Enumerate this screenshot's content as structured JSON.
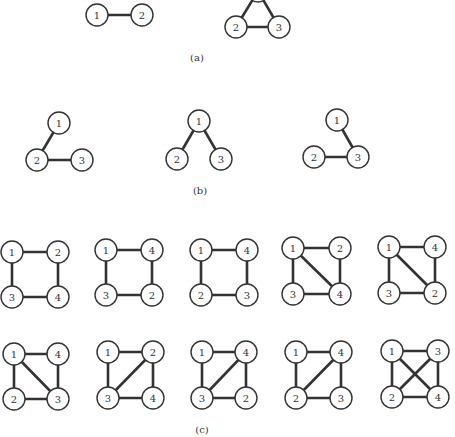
{
  "style": {
    "ink": "#333333",
    "background": "#ffffff",
    "node_radius": 11
  },
  "captions": {
    "a": "(a)",
    "b": "(b)",
    "c": "(c)"
  },
  "caption_positions": {
    "a": [
      197,
      52
    ],
    "b": [
      200,
      185
    ],
    "c": [
      202,
      424
    ]
  },
  "graphs": [
    {
      "part": "a",
      "id": "a1",
      "nodes": [
        {
          "label": "1",
          "x": 97,
          "y": 15
        },
        {
          "label": "2",
          "x": 142,
          "y": 15
        }
      ],
      "edges": [
        [
          "1",
          "2"
        ]
      ]
    },
    {
      "part": "a",
      "id": "a2",
      "nodes": [
        {
          "label": "1",
          "x": 258,
          "y": -9
        },
        {
          "label": "2",
          "x": 236,
          "y": 27
        },
        {
          "label": "3",
          "x": 279,
          "y": 27
        }
      ],
      "edges": [
        [
          "1",
          "2"
        ],
        [
          "1",
          "3"
        ],
        [
          "2",
          "3"
        ]
      ]
    },
    {
      "part": "b",
      "id": "b1",
      "nodes": [
        {
          "label": "1",
          "x": 59,
          "y": 123
        },
        {
          "label": "2",
          "x": 37,
          "y": 160
        },
        {
          "label": "3",
          "x": 82,
          "y": 160
        }
      ],
      "edges": [
        [
          "1",
          "2"
        ],
        [
          "2",
          "3"
        ]
      ]
    },
    {
      "part": "b",
      "id": "b2",
      "nodes": [
        {
          "label": "1",
          "x": 199,
          "y": 121
        },
        {
          "label": "2",
          "x": 177,
          "y": 159
        },
        {
          "label": "3",
          "x": 221,
          "y": 159
        }
      ],
      "edges": [
        [
          "1",
          "2"
        ],
        [
          "1",
          "3"
        ]
      ]
    },
    {
      "part": "b",
      "id": "b3",
      "nodes": [
        {
          "label": "1",
          "x": 337,
          "y": 120
        },
        {
          "label": "2",
          "x": 314,
          "y": 157
        },
        {
          "label": "3",
          "x": 358,
          "y": 157
        }
      ],
      "edges": [
        [
          "1",
          "3"
        ],
        [
          "2",
          "3"
        ]
      ]
    },
    {
      "part": "c",
      "id": "c1",
      "nodes": [
        {
          "label": "1",
          "x": 12,
          "y": 252
        },
        {
          "label": "2",
          "x": 58,
          "y": 252
        },
        {
          "label": "3",
          "x": 12,
          "y": 297
        },
        {
          "label": "4",
          "x": 58,
          "y": 297
        }
      ],
      "edges": [
        [
          "1",
          "2"
        ],
        [
          "2",
          "4"
        ],
        [
          "4",
          "3"
        ],
        [
          "3",
          "1"
        ]
      ]
    },
    {
      "part": "c",
      "id": "c2",
      "nodes": [
        {
          "label": "1",
          "x": 106,
          "y": 250
        },
        {
          "label": "4",
          "x": 152,
          "y": 250
        },
        {
          "label": "3",
          "x": 106,
          "y": 295
        },
        {
          "label": "2",
          "x": 152,
          "y": 295
        }
      ],
      "edges": [
        [
          "1",
          "4"
        ],
        [
          "4",
          "2"
        ],
        [
          "2",
          "3"
        ],
        [
          "3",
          "1"
        ]
      ]
    },
    {
      "part": "c",
      "id": "c3",
      "nodes": [
        {
          "label": "1",
          "x": 201,
          "y": 250
        },
        {
          "label": "4",
          "x": 247,
          "y": 250
        },
        {
          "label": "2",
          "x": 201,
          "y": 295
        },
        {
          "label": "3",
          "x": 247,
          "y": 295
        }
      ],
      "edges": [
        [
          "1",
          "4"
        ],
        [
          "4",
          "3"
        ],
        [
          "3",
          "2"
        ],
        [
          "2",
          "1"
        ]
      ]
    },
    {
      "part": "c",
      "id": "c4",
      "nodes": [
        {
          "label": "1",
          "x": 293,
          "y": 248
        },
        {
          "label": "2",
          "x": 340,
          "y": 248
        },
        {
          "label": "3",
          "x": 293,
          "y": 294
        },
        {
          "label": "4",
          "x": 340,
          "y": 294
        }
      ],
      "edges": [
        [
          "1",
          "2"
        ],
        [
          "2",
          "4"
        ],
        [
          "4",
          "3"
        ],
        [
          "3",
          "1"
        ],
        [
          "1",
          "4"
        ]
      ]
    },
    {
      "part": "c",
      "id": "c5",
      "nodes": [
        {
          "label": "1",
          "x": 389,
          "y": 247
        },
        {
          "label": "4",
          "x": 435,
          "y": 247
        },
        {
          "label": "3",
          "x": 389,
          "y": 293
        },
        {
          "label": "2",
          "x": 435,
          "y": 293
        }
      ],
      "edges": [
        [
          "1",
          "4"
        ],
        [
          "4",
          "2"
        ],
        [
          "2",
          "3"
        ],
        [
          "3",
          "1"
        ],
        [
          "1",
          "2"
        ]
      ]
    },
    {
      "part": "c",
      "id": "c6",
      "nodes": [
        {
          "label": "1",
          "x": 14,
          "y": 354
        },
        {
          "label": "4",
          "x": 58,
          "y": 354
        },
        {
          "label": "2",
          "x": 14,
          "y": 399
        },
        {
          "label": "3",
          "x": 58,
          "y": 399
        }
      ],
      "edges": [
        [
          "1",
          "4"
        ],
        [
          "4",
          "3"
        ],
        [
          "3",
          "2"
        ],
        [
          "2",
          "1"
        ],
        [
          "1",
          "3"
        ]
      ]
    },
    {
      "part": "c",
      "id": "c7",
      "nodes": [
        {
          "label": "1",
          "x": 108,
          "y": 352
        },
        {
          "label": "2",
          "x": 153,
          "y": 352
        },
        {
          "label": "3",
          "x": 108,
          "y": 398
        },
        {
          "label": "4",
          "x": 153,
          "y": 398
        }
      ],
      "edges": [
        [
          "1",
          "2"
        ],
        [
          "2",
          "4"
        ],
        [
          "4",
          "3"
        ],
        [
          "3",
          "1"
        ],
        [
          "2",
          "3"
        ]
      ]
    },
    {
      "part": "c",
      "id": "c8",
      "nodes": [
        {
          "label": "1",
          "x": 202,
          "y": 352
        },
        {
          "label": "4",
          "x": 246,
          "y": 352
        },
        {
          "label": "3",
          "x": 202,
          "y": 398
        },
        {
          "label": "2",
          "x": 246,
          "y": 398
        }
      ],
      "edges": [
        [
          "1",
          "4"
        ],
        [
          "4",
          "2"
        ],
        [
          "2",
          "3"
        ],
        [
          "3",
          "1"
        ],
        [
          "4",
          "3"
        ]
      ]
    },
    {
      "part": "c",
      "id": "c9",
      "nodes": [
        {
          "label": "1",
          "x": 296,
          "y": 352
        },
        {
          "label": "4",
          "x": 341,
          "y": 352
        },
        {
          "label": "2",
          "x": 296,
          "y": 398
        },
        {
          "label": "3",
          "x": 341,
          "y": 398
        }
      ],
      "edges": [
        [
          "1",
          "4"
        ],
        [
          "4",
          "3"
        ],
        [
          "3",
          "2"
        ],
        [
          "2",
          "1"
        ],
        [
          "4",
          "2"
        ]
      ]
    },
    {
      "part": "c",
      "id": "c10",
      "nodes": [
        {
          "label": "1",
          "x": 392,
          "y": 351
        },
        {
          "label": "3",
          "x": 438,
          "y": 351
        },
        {
          "label": "2",
          "x": 392,
          "y": 397
        },
        {
          "label": "4",
          "x": 438,
          "y": 397
        }
      ],
      "edges": [
        [
          "1",
          "3"
        ],
        [
          "3",
          "4"
        ],
        [
          "4",
          "2"
        ],
        [
          "2",
          "1"
        ],
        [
          "1",
          "4"
        ],
        [
          "3",
          "2"
        ]
      ]
    }
  ]
}
